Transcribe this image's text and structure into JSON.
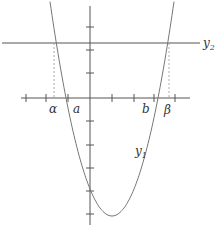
{
  "diagram": {
    "colors": {
      "axis": "#555555",
      "curve": "#777777",
      "line": "#555555",
      "dashed": "#999999",
      "text": "#333333"
    },
    "labels": {
      "alpha": "α",
      "a": "a",
      "b": "b",
      "beta": "β",
      "y1": "y",
      "y1_sub": "1",
      "y2": "y",
      "y2_sub": "2"
    },
    "curve": {
      "name": "y1",
      "type": "parabola",
      "opens": "up"
    },
    "line": {
      "name": "y2",
      "type": "horizontal"
    },
    "x_axis_ticks": 8,
    "y_axis_ticks": 8
  }
}
